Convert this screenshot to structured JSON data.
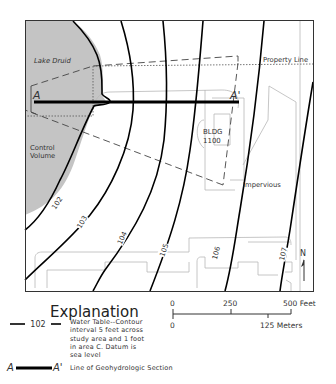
{
  "map": {
    "labels": {
      "lake": "Lake Druid",
      "control_volume_1": "Control",
      "control_volume_2": "Volume",
      "property_line": "Property Line",
      "building_1": "BLDG",
      "building_2": "1100",
      "impervious": "Impervious",
      "section_start": "A",
      "section_end": "A'",
      "north": "N"
    },
    "contours": [
      {
        "value": "102"
      },
      {
        "value": "103"
      },
      {
        "value": "104"
      },
      {
        "value": "105"
      },
      {
        "value": "106"
      },
      {
        "value": "107"
      }
    ],
    "colors": {
      "water_fill": "#c4c4c4",
      "contour": "#000000",
      "outline": "#b8b8b8",
      "frame": "#333333"
    }
  },
  "legend": {
    "title": "Explanation",
    "contour_sample_value": "102",
    "contour_desc_lines": [
      "Water Table--Contour",
      "interval 5 feet across",
      "study area and 1 foot",
      "in area C. Datum is",
      "sea level"
    ],
    "section_start": "A",
    "section_end": "A'",
    "section_desc": "Line of Geohydrologic Section"
  },
  "scale_bar": {
    "feet_ticks": [
      "0",
      "250",
      "500 Feet"
    ],
    "meter_ticks": [
      "0",
      "125 Meters"
    ]
  }
}
